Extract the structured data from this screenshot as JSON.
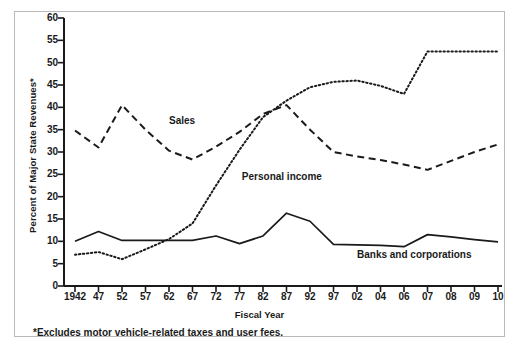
{
  "figure": {
    "y_axis_title": "Percent of Major State Revenues*",
    "x_axis_title": "Fiscal Year",
    "footnote": "*Excludes motor vehicle-related taxes and user fees."
  },
  "series_labels": {
    "sales": "Sales",
    "personal_income": "Personal income",
    "banks": "Banks and corporations"
  },
  "chart_data": {
    "type": "line",
    "title": "",
    "xlabel": "Fiscal Year",
    "ylabel": "Percent of Major State Revenues*",
    "grid": false,
    "legend_position": "inline-annotations",
    "ylim": [
      0,
      60
    ],
    "yticks": [
      0,
      5,
      10,
      15,
      20,
      25,
      30,
      35,
      40,
      45,
      50,
      55,
      60
    ],
    "categories": [
      "1942",
      "47",
      "52",
      "57",
      "62",
      "67",
      "72",
      "77",
      "82",
      "87",
      "92",
      "97",
      "02",
      "04",
      "06",
      "07",
      "08",
      "09",
      "10"
    ],
    "series": [
      {
        "name": "Sales",
        "style": "dashed",
        "color": "#1a1a1a",
        "values": [
          34.8,
          31.0,
          40.5,
          35.0,
          30.3,
          28.3,
          31.2,
          34.5,
          38.5,
          40.5,
          35.0,
          30.0,
          29.0,
          28.2,
          27.2,
          26.0,
          28.0,
          30.0,
          31.7
        ]
      },
      {
        "name": "Personal income",
        "style": "dotted",
        "color": "#1a1a1a",
        "values": [
          7.0,
          7.6,
          6.0,
          8.2,
          10.5,
          14.0,
          22.5,
          30.5,
          37.8,
          41.5,
          44.5,
          45.7,
          46.0,
          44.8,
          43.0,
          52.5,
          52.5,
          52.5,
          52.5
        ]
      },
      {
        "name": "Banks and corporations",
        "style": "solid",
        "color": "#1a1a1a",
        "values": [
          10.0,
          12.2,
          10.2,
          10.2,
          10.2,
          10.2,
          11.2,
          9.5,
          11.2,
          16.3,
          14.5,
          9.3,
          9.2,
          9.1,
          8.8,
          11.5,
          11.0,
          10.4,
          9.9
        ]
      }
    ],
    "annotations": [
      {
        "text": "Sales",
        "x_index": 4,
        "y_value": 37.0
      },
      {
        "text": "Personal income",
        "x_index": 7.1,
        "y_value": 24.5
      },
      {
        "text": "Banks and corporations",
        "x_index": 12.0,
        "y_value": 7.0
      }
    ]
  }
}
